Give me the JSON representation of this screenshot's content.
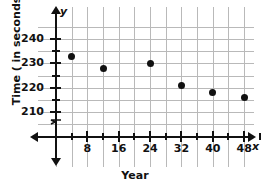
{
  "chart_data": {
    "type": "scatter",
    "title": "",
    "xlabel": "Year",
    "ylabel": "Time ( in seconds)",
    "x_axis_letter": "x",
    "y_axis_letter": "y",
    "xlim": [
      0,
      52
    ],
    "ylim": [
      205,
      243
    ],
    "grid": true,
    "legend": null,
    "y_axis_break": true,
    "x_ticks": [
      8,
      16,
      24,
      32,
      40,
      48
    ],
    "x_tick_labels": [
      "8",
      "16",
      "24",
      "32",
      "40",
      "48"
    ],
    "y_ticks": [
      210,
      220,
      230,
      240
    ],
    "y_tick_labels": [
      "210",
      "220",
      "230",
      "240"
    ],
    "x_minor_step": 4,
    "y_minor_step": 5,
    "points": [
      {
        "x": 4,
        "y": 233
      },
      {
        "x": 12,
        "y": 228
      },
      {
        "x": 24,
        "y": 230
      },
      {
        "x": 32,
        "y": 221
      },
      {
        "x": 40,
        "y": 218
      },
      {
        "x": 48,
        "y": 216
      }
    ],
    "colors": {
      "point": "#111111",
      "axis": "#111111",
      "grid": "#b9b9b9",
      "background": "#ffffff",
      "text": "#111111"
    }
  }
}
